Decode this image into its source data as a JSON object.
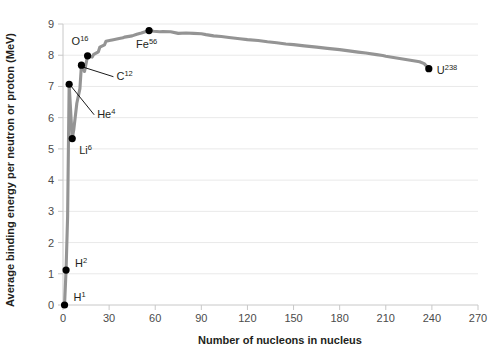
{
  "chart_data": {
    "type": "line",
    "title": "",
    "xlabel": "Number of nucleons in nucleus",
    "ylabel": "Average binding energy per neutron or proton (MeV)",
    "xlim": [
      0,
      270
    ],
    "ylim": [
      0,
      9
    ],
    "xticks": [
      0,
      30,
      60,
      90,
      120,
      150,
      180,
      210,
      240,
      270
    ],
    "yticks": [
      0,
      1,
      2,
      3,
      4,
      5,
      6,
      7,
      8,
      9
    ],
    "grid": "horizontal",
    "legend": "none",
    "line_color": "#949494",
    "marker_color": "#000000",
    "series": [
      {
        "name": "Average binding energy per nucleon",
        "x": [
          1,
          2,
          3,
          4,
          6,
          7,
          9,
          11,
          12,
          14,
          16,
          19,
          20,
          23,
          24,
          27,
          28,
          31,
          32,
          35,
          39,
          40,
          45,
          48,
          51,
          56,
          59,
          63,
          65,
          70,
          75,
          80,
          85,
          90,
          93,
          98,
          103,
          108,
          115,
          120,
          127,
          133,
          139,
          145,
          150,
          157,
          165,
          172,
          180,
          186,
          192,
          197,
          204,
          208,
          210,
          215,
          220,
          226,
          232,
          235,
          238
        ],
        "y": [
          0.0,
          1.12,
          2.83,
          7.07,
          5.33,
          5.61,
          6.46,
          6.93,
          7.68,
          7.48,
          7.98,
          7.94,
          8.03,
          8.11,
          8.26,
          8.33,
          8.45,
          8.48,
          8.49,
          8.52,
          8.56,
          8.58,
          8.62,
          8.67,
          8.71,
          8.79,
          8.77,
          8.75,
          8.76,
          8.75,
          8.7,
          8.71,
          8.7,
          8.69,
          8.66,
          8.62,
          8.6,
          8.57,
          8.53,
          8.5,
          8.47,
          8.43,
          8.4,
          8.36,
          8.34,
          8.3,
          8.26,
          8.22,
          8.18,
          8.14,
          8.1,
          8.07,
          8.02,
          7.99,
          7.97,
          7.93,
          7.89,
          7.84,
          7.79,
          7.73,
          7.57
        ]
      }
    ],
    "labeled_points": [
      {
        "id": "H1",
        "element": "H",
        "mass": "1",
        "x": 1,
        "y": 0.0,
        "label_dx": 9,
        "label_dy": -4,
        "leader": false
      },
      {
        "id": "H2",
        "element": "H",
        "mass": "2",
        "x": 2,
        "y": 1.12,
        "label_dx": 9,
        "label_dy": -3,
        "leader": false
      },
      {
        "id": "He4",
        "element": "He",
        "mass": "4",
        "x": 4,
        "y": 7.07,
        "label_dx": 28,
        "label_dy": 34,
        "leader": true
      },
      {
        "id": "Li6",
        "element": "Li",
        "mass": "6",
        "x": 6,
        "y": 5.33,
        "label_dx": 7,
        "label_dy": 15,
        "leader": false
      },
      {
        "id": "C12",
        "element": "C",
        "mass": "12",
        "x": 12,
        "y": 7.68,
        "label_dx": 35,
        "label_dy": 15,
        "leader": true
      },
      {
        "id": "O16",
        "element": "O",
        "mass": "16",
        "x": 16,
        "y": 7.98,
        "label_dx": -16,
        "label_dy": -11,
        "leader": false
      },
      {
        "id": "Fe56",
        "element": "Fe",
        "mass": "56",
        "x": 56,
        "y": 8.79,
        "label_dx": -13,
        "label_dy": 17,
        "leader": false
      },
      {
        "id": "U238",
        "element": "U",
        "mass": "238",
        "x": 238,
        "y": 7.57,
        "label_dx": 8,
        "label_dy": 5,
        "leader": false
      }
    ]
  }
}
